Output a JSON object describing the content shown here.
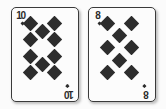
{
  "scene": {
    "width": 166,
    "height": 109,
    "background_color": "#fbfbfb",
    "description": "Two playing cards side by side"
  },
  "style": {
    "card_face_color": "#fcfcfc",
    "card_border_color": "#3a3a3a",
    "pip_color": "#2d2d2d",
    "index_text_color": "#2b2b2b"
  },
  "cards": [
    {
      "id": "card-ten-of-diamonds",
      "name": "ten-of-diamonds",
      "rank": "10",
      "suit": "diamonds",
      "suit_symbol": "♦",
      "pip_count": 10,
      "box": {
        "left": 11,
        "top": 7,
        "width": 68,
        "height": 95
      },
      "corner_index": {
        "rank": "10",
        "suit_symbol": "♦"
      },
      "pip_positions": [
        {
          "x": 18,
          "y": 8
        },
        {
          "x": 18,
          "y": 30
        },
        {
          "x": 18,
          "y": 52
        },
        {
          "x": 18,
          "y": 74
        },
        {
          "x": 70,
          "y": 8
        },
        {
          "x": 70,
          "y": 30
        },
        {
          "x": 70,
          "y": 52
        },
        {
          "x": 70,
          "y": 74
        },
        {
          "x": 44,
          "y": 19
        },
        {
          "x": 44,
          "y": 63
        }
      ]
    },
    {
      "id": "card-eight-of-diamonds",
      "name": "eight-of-diamonds",
      "rank": "8",
      "suit": "diamonds",
      "suit_symbol": "♦",
      "pip_count": 8,
      "box": {
        "left": 88,
        "top": 7,
        "width": 68,
        "height": 95
      },
      "corner_index": {
        "rank": "8",
        "suit_symbol": "♦"
      },
      "pip_positions": [
        {
          "x": 18,
          "y": 8
        },
        {
          "x": 18,
          "y": 41
        },
        {
          "x": 18,
          "y": 74
        },
        {
          "x": 70,
          "y": 8
        },
        {
          "x": 70,
          "y": 41
        },
        {
          "x": 70,
          "y": 74
        },
        {
          "x": 44,
          "y": 25
        },
        {
          "x": 44,
          "y": 58
        }
      ]
    }
  ]
}
